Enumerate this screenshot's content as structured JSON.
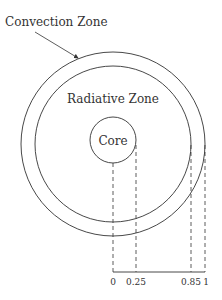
{
  "labels": {
    "convection": "Convection Zone",
    "radiative": "Radiative Zone",
    "core": "Core"
  },
  "axis": {
    "ticks": [
      "0",
      "0.25",
      "0.85",
      "1"
    ]
  },
  "colors": {
    "stroke": "#333333"
  }
}
